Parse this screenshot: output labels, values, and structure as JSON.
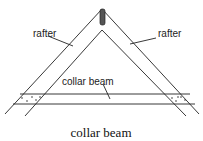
{
  "diagram": {
    "labels": {
      "rafter_left": "rafter",
      "rafter_right": "rafter",
      "collar_beam": "collar beam"
    },
    "caption": "collar beam",
    "colors": {
      "line": "#222222",
      "background": "#ffffff"
    }
  }
}
